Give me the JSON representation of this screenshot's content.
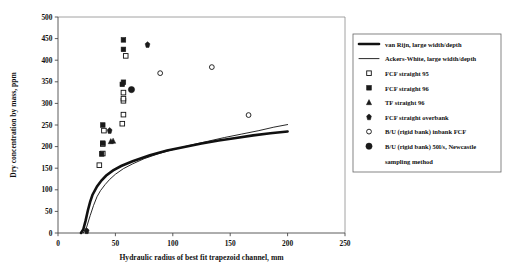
{
  "chart_data": {
    "type": "scatter",
    "title": "",
    "xlabel": "Hydraulic radius of best fit trapezoid channel, mm",
    "ylabel": "Dry concentration by mass, ppm",
    "xlim": [
      0,
      250
    ],
    "ylim": [
      0,
      500
    ],
    "xticks": [
      0,
      50,
      100,
      150,
      200,
      250
    ],
    "yticks": [
      0,
      50,
      100,
      150,
      200,
      250,
      300,
      350,
      400,
      450,
      500
    ],
    "grid": false,
    "legend_position": "right",
    "series": [
      {
        "name": "van Rijn, large width/depth",
        "marker": "thick-line",
        "type": "line",
        "points": [
          [
            20,
            0
          ],
          [
            22,
            8
          ],
          [
            24,
            28
          ],
          [
            26,
            52
          ],
          [
            28,
            72
          ],
          [
            30,
            88
          ],
          [
            34,
            108
          ],
          [
            38,
            122
          ],
          [
            42,
            133
          ],
          [
            48,
            145
          ],
          [
            55,
            155
          ],
          [
            65,
            166
          ],
          [
            80,
            180
          ],
          [
            95,
            191
          ],
          [
            110,
            199
          ],
          [
            125,
            207
          ],
          [
            140,
            214
          ],
          [
            155,
            220
          ],
          [
            170,
            226
          ],
          [
            185,
            231
          ],
          [
            200,
            235
          ]
        ]
      },
      {
        "name": "Ackers-White, large width/depth",
        "marker": "thin-line",
        "type": "line",
        "points": [
          [
            22,
            0
          ],
          [
            25,
            14
          ],
          [
            28,
            40
          ],
          [
            31,
            64
          ],
          [
            34,
            84
          ],
          [
            37,
            98
          ],
          [
            41,
            112
          ],
          [
            45,
            124
          ],
          [
            50,
            136
          ],
          [
            57,
            149
          ],
          [
            65,
            160
          ],
          [
            75,
            172
          ],
          [
            88,
            184
          ],
          [
            100,
            193
          ],
          [
            115,
            203
          ],
          [
            130,
            212
          ],
          [
            145,
            221
          ],
          [
            160,
            229
          ],
          [
            175,
            237
          ],
          [
            188,
            245
          ],
          [
            200,
            251
          ]
        ]
      },
      {
        "name": "FCF straight 95",
        "marker": "open-square",
        "type": "scatter",
        "points": [
          [
            36,
            157
          ],
          [
            39,
            184
          ],
          [
            39,
            206
          ],
          [
            40,
            237
          ],
          [
            56,
            253
          ],
          [
            57,
            274
          ],
          [
            57,
            306
          ],
          [
            57,
            311
          ],
          [
            57,
            325
          ],
          [
            59,
            410
          ]
        ]
      },
      {
        "name": "FCF straight 96",
        "marker": "filled-square",
        "type": "scatter",
        "points": [
          [
            38,
            183
          ],
          [
            39,
            208
          ],
          [
            39,
            250
          ],
          [
            56,
            344
          ],
          [
            57,
            349
          ],
          [
            57,
            425
          ],
          [
            57,
            447
          ]
        ]
      },
      {
        "name": "TF straight 96",
        "marker": "triangle",
        "type": "scatter",
        "points": [
          [
            46,
            212
          ],
          [
            48,
            213
          ]
        ]
      },
      {
        "name": "FCF straight overbank",
        "marker": "diamond",
        "type": "scatter",
        "points": [
          [
            25,
            5
          ],
          [
            45,
            237
          ],
          [
            78,
            436
          ]
        ]
      },
      {
        "name": "B/U (rigid bank) inbank FCF",
        "marker": "open-circle",
        "type": "scatter",
        "points": [
          [
            89,
            370
          ],
          [
            134,
            384
          ],
          [
            166,
            273
          ]
        ]
      },
      {
        "name": "B/U (rigid bank) 50l/s, Newcastle sampling method",
        "marker": "filled-circle",
        "type": "scatter",
        "points": [
          [
            64,
            332
          ]
        ]
      }
    ]
  },
  "legend": {
    "items": [
      {
        "label": "van Rijn, large width/depth",
        "marker": "thick-line"
      },
      {
        "label": "Ackers-White, large width/depth",
        "marker": "thin-line"
      },
      {
        "label": "FCF straight 95",
        "marker": "open-square"
      },
      {
        "label": "FCF straight 96",
        "marker": "filled-square"
      },
      {
        "label": "TF straight 96",
        "marker": "triangle"
      },
      {
        "label": "FCF straight overbank",
        "marker": "diamond"
      },
      {
        "label": "B/U (rigid bank) inbank FCF",
        "marker": "open-circle"
      },
      {
        "label": "B/U (rigid bank) 50l/s, Newcastle",
        "marker": "filled-circle"
      },
      {
        "label": "sampling method",
        "marker": "none"
      }
    ]
  },
  "axes": {
    "x_tick_labels": [
      "0",
      "50",
      "100",
      "150",
      "200",
      "250"
    ],
    "y_tick_labels": [
      "0",
      "50",
      "100",
      "150",
      "200",
      "250",
      "300",
      "350",
      "400",
      "450",
      "500"
    ],
    "x_title": "Hydraulic radius of best fit trapezoid channel, mm",
    "y_title": "Dry concentration by mass, ppm"
  },
  "colors": {
    "ink": "#111111",
    "axis": "#4a4a4a",
    "frame": "#8a8a8a",
    "background": "#ffffff"
  }
}
